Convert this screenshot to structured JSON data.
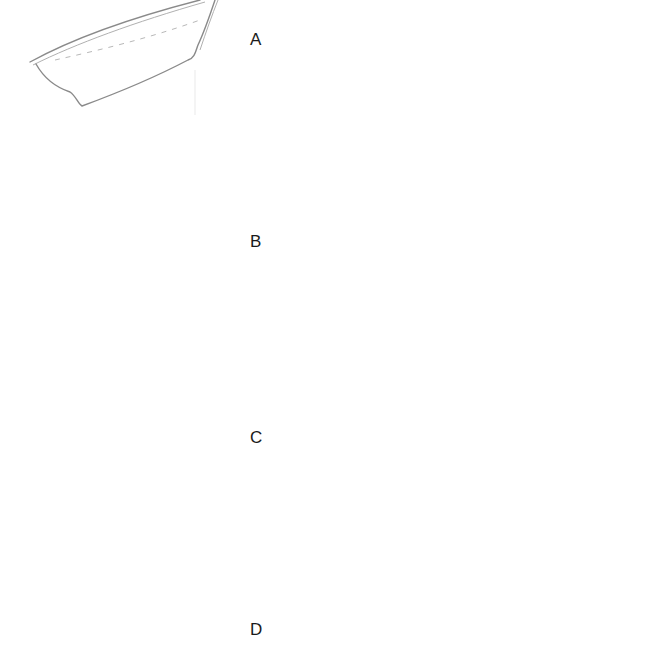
{
  "figure": {
    "panels": [
      {
        "id": "A",
        "label": "A",
        "boat_view": "hull-sketch-heeled-steep",
        "trace": "single-loop-tilted"
      },
      {
        "id": "B",
        "label": "B",
        "boat_view": "hull-sketch-heeled",
        "trace": "figure-eight-tilted"
      },
      {
        "id": "C",
        "label": "C",
        "boat_view": "hull-sketch-level",
        "trace": "figure-eight-level"
      },
      {
        "id": "D",
        "label": "D",
        "boat_view": "hull-sketch-bow-down",
        "trace": "figure-eight-inverted"
      }
    ],
    "colors": {
      "stroke": "#8a8a8a",
      "light_stroke": "#b8b8b8",
      "label": "#1a1a1a",
      "background": "#ffffff"
    }
  }
}
